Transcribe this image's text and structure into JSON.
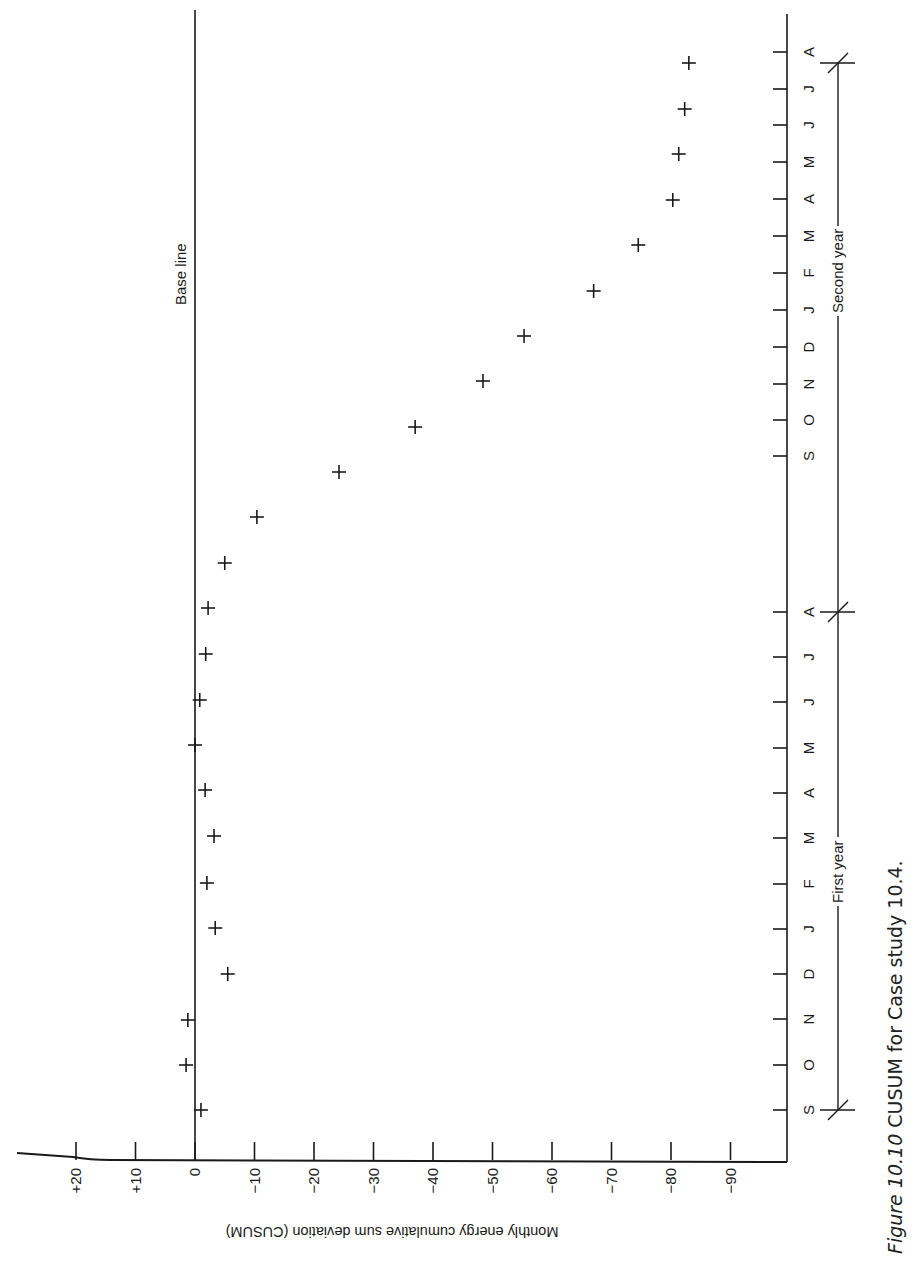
{
  "chart_data": {
    "type": "scatter",
    "title": "Figure 10.10 CUSUM for Case study 10.4.",
    "orientation": "rotated 90deg (months run along the right edge, values increase toward the left)",
    "xlabel": "Month",
    "ylabel": "Monthly energy cumulative sum deviation (CUSUM)",
    "ylim": [
      -100,
      20
    ],
    "yticks": [
      "+20",
      "+10",
      "0",
      "−10",
      "−20",
      "−30",
      "−40",
      "−50",
      "−60",
      "−70",
      "−80",
      "−90"
    ],
    "ytick_values": [
      20,
      10,
      0,
      -10,
      -20,
      -30,
      -40,
      -50,
      -60,
      -70,
      -80,
      -90
    ],
    "baseline": {
      "value": 0,
      "label": "Base line"
    },
    "categories": [
      "S",
      "O",
      "N",
      "D",
      "J",
      "F",
      "M",
      "A",
      "M",
      "J",
      "J",
      "A",
      "S",
      "O",
      "N",
      "D",
      "J",
      "F",
      "M",
      "A",
      "M",
      "J",
      "J",
      "A"
    ],
    "groups": [
      {
        "label": "First year",
        "from_index": 0,
        "to_index": 11
      },
      {
        "label": "Second year",
        "from_index": 11,
        "to_index": 23
      }
    ],
    "series": [
      {
        "name": "CUSUM",
        "marker": "+",
        "values": [
          -1,
          1.5,
          1.2,
          -5.5,
          -3.4,
          -2,
          -3.2,
          -1.7,
          0,
          -0.8,
          -1.8,
          -2.2,
          -5,
          -10.4,
          -24.2,
          -37,
          -48.4,
          -55.3,
          -67,
          -74.5,
          -80.3,
          -81.3,
          -82.3,
          -83
        ]
      }
    ],
    "grid": false,
    "legend": null
  },
  "labels": {
    "baseline": "Base line",
    "yaxis_title": "Monthly energy cumulative sum deviation (CUSUM)",
    "first_year": "First year",
    "second_year": "Second year",
    "caption_fig": "Figure  10.10",
    "caption_text": "CUSUM for Case study 10.4."
  },
  "colors": {
    "ink": "#1a1a1a",
    "background": "#ffffff"
  }
}
